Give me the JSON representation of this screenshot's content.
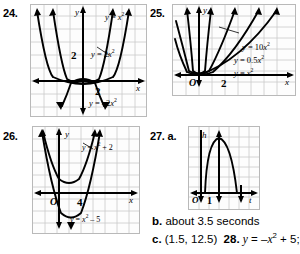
{
  "page": {
    "width": 300,
    "height": 254,
    "background": "#ffffff",
    "ink": "#000000",
    "grid_color": "#c9c9c9",
    "frame_color": "#b9b9b9"
  },
  "exercises": [
    {
      "id": "ex24",
      "number": "24.",
      "axis_labels": {
        "x": "x",
        "y": "y"
      },
      "tick_labels": {
        "x": "2",
        "y": "2"
      },
      "curve_labels": [
        {
          "key": "c1",
          "text": "y = x²",
          "html": "<span class='mathi'>y</span> = <span class='mathi'>x</span><sup>2</sup>"
        },
        {
          "key": "c2",
          "text": "y = 2x²",
          "html": "<span class='mathi'>y</span> = 2<span class='mathi'>x</span><sup>2</sup>"
        },
        {
          "key": "c3",
          "text": "y = -2x²",
          "html": "<span class='mathi'>y</span> = –2<span class='mathi'>x</span><sup>2</sup>"
        }
      ]
    },
    {
      "id": "ex25",
      "number": "25.",
      "axis_labels": {
        "x": "x",
        "y": "y"
      },
      "tick_labels": {
        "origin": "O",
        "x": "2"
      },
      "curve_labels": [
        {
          "key": "c1",
          "text": "y = 10x²",
          "html": "<span class='mathi'>y</span> = 10<span class='mathi'>x</span><sup>2</sup>"
        },
        {
          "key": "c2",
          "text": "y = 0.5x²",
          "html": "<span class='mathi'>y</span> = 0.5<span class='mathi'>x</span><sup>2</sup>"
        },
        {
          "key": "c3",
          "text": "y = x²",
          "html": "<span class='mathi'>y</span> = <span class='mathi'>x</span><sup>2</sup>"
        }
      ]
    },
    {
      "id": "ex26",
      "number": "26.",
      "axis_labels": {
        "x": "x",
        "y": "y"
      },
      "tick_labels": {
        "origin": "O",
        "x": "4"
      },
      "curve_labels": [
        {
          "key": "c1",
          "text": "y = x² + 2",
          "html": "<span class='mathi'>y</span> = <span class='mathi'>x</span><sup>2</sup> + 2"
        },
        {
          "key": "c2",
          "text": "y = x² - 5",
          "html": "<span class='mathi'>y</span> = <span class='mathi'>x</span><sup>2</sup> – 5"
        }
      ]
    },
    {
      "id": "ex27",
      "number": "27. a.",
      "axis_labels": {
        "x": "t",
        "y": "h"
      },
      "tick_labels": {
        "origin": "O",
        "x": "1"
      },
      "curve_labels": []
    }
  ],
  "answers": [
    {
      "id": "ans_b",
      "label": "b.",
      "text": "about 3.5 seconds",
      "html": "<b>b.</b> about 3.5 seconds"
    },
    {
      "id": "ans_c",
      "label": "c.",
      "text": "(1.5, 12.5)   28. y = -x² + 5;",
      "html": "<b>c.</b> (1.5, 12.5)&nbsp; <b>28.</b> <span class='mathi'>y</span> = –<span class='mathi'>x</span><sup>2</sup> + 5;"
    }
  ],
  "chart_data": [
    {
      "id": "ex24",
      "type": "line",
      "title": "24.",
      "xlabel": "x",
      "ylabel": "y",
      "xlim": [
        -4,
        4
      ],
      "ylim": [
        -3,
        5
      ],
      "grid": true,
      "xticks": [
        2
      ],
      "yticks": [
        2
      ],
      "series": [
        {
          "name": "y = x²",
          "equation": "y = x^2",
          "a": 1,
          "opens": "up"
        },
        {
          "name": "y = 2x²",
          "equation": "y = 2x^2",
          "a": 2,
          "opens": "up"
        },
        {
          "name": "y = -2x²",
          "equation": "y = -2x^2",
          "a": -2,
          "opens": "down"
        }
      ]
    },
    {
      "id": "ex25",
      "type": "line",
      "title": "25.",
      "xlabel": "x",
      "ylabel": "y",
      "xlim": [
        -4,
        5
      ],
      "ylim": [
        -1,
        7
      ],
      "grid": true,
      "xticks": [
        2
      ],
      "yticks": [],
      "series": [
        {
          "name": "y = 10x²",
          "equation": "y = 10x^2",
          "a": 10,
          "opens": "up"
        },
        {
          "name": "y = 0.5x²",
          "equation": "y = 0.5x^2",
          "a": 0.5,
          "opens": "up"
        },
        {
          "name": "y = x²",
          "equation": "y = x^2",
          "a": 1,
          "opens": "up"
        }
      ]
    },
    {
      "id": "ex26",
      "type": "line",
      "title": "26.",
      "xlabel": "x",
      "ylabel": "y",
      "xlim": [
        -3,
        6
      ],
      "ylim": [
        -7,
        6
      ],
      "grid": true,
      "xticks": [
        4
      ],
      "yticks": [],
      "series": [
        {
          "name": "y = x² + 2",
          "equation": "y = x^2 + 2",
          "a": 1,
          "k": 2,
          "opens": "up"
        },
        {
          "name": "y = x² - 5",
          "equation": "y = x^2 - 5",
          "a": 1,
          "k": -5,
          "opens": "up"
        }
      ]
    },
    {
      "id": "ex27",
      "type": "line",
      "title": "27. a.",
      "xlabel": "t",
      "ylabel": "h",
      "xlim": [
        -1,
        5
      ],
      "ylim": [
        -1,
        7
      ],
      "grid": true,
      "xticks": [
        1
      ],
      "yticks": [],
      "series": [
        {
          "name": "h(t)",
          "equation": "h = -16t^2 + 48t",
          "vertex": [
            1.5,
            12.5
          ],
          "opens": "down"
        }
      ]
    }
  ]
}
